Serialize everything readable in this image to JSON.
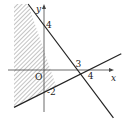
{
  "diagram": {
    "type": "inequality-region",
    "axis_labels": {
      "x": "x",
      "y": "y"
    },
    "origin_label": "O",
    "lines": [
      {
        "name": "line-1",
        "equation": "y = 4 - (4/3)x",
        "y_intercept": 4,
        "x_intercept": 3
      },
      {
        "name": "line-2",
        "equation": "y = (1/2)x - 2",
        "y_intercept": -2,
        "x_intercept": 4
      }
    ],
    "tick_labels": {
      "y_pos": "4",
      "y_neg": "-2",
      "x_3": "3",
      "x_4": "4"
    },
    "shaded_region": "left of line-1 and above line-2",
    "colors": {
      "line": "#222222",
      "axis": "#444444",
      "hatch": "#888888"
    }
  }
}
